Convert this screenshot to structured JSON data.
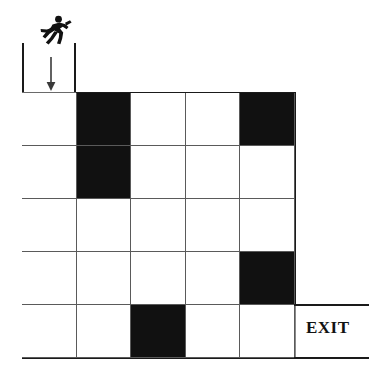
{
  "figure": {
    "name": "maze-puzzle",
    "grid_rows": 5,
    "grid_cols": 5
  },
  "entrance": {
    "icon_name": "running-person-icon",
    "arrow_icon_name": "arrow-down-icon",
    "position_label": "top-left",
    "column": 1
  },
  "exit": {
    "label": "EXIT",
    "position_label": "right-bottom-row",
    "row": 5
  },
  "colors": {
    "blocked_cell": "#111111",
    "open_cell": "#ffffff",
    "grid_line": "#5a5a5a",
    "outer_wall": "#1a1a1a"
  },
  "chart_data": {
    "type": "heatmap",
    "title": "",
    "xlabel": "",
    "ylabel": "",
    "categories": [
      "c1",
      "c2",
      "c3",
      "c4",
      "c5"
    ],
    "rows": [
      "r1",
      "r2",
      "r3",
      "r4",
      "r5"
    ],
    "legend": [
      "open",
      "blocked"
    ],
    "values": [
      [
        0,
        1,
        0,
        0,
        1
      ],
      [
        0,
        1,
        0,
        0,
        0
      ],
      [
        0,
        0,
        0,
        0,
        0
      ],
      [
        0,
        0,
        0,
        0,
        1
      ],
      [
        0,
        0,
        1,
        0,
        0
      ]
    ]
  },
  "grid": {
    "rows": [
      {
        "cells": [
          {
            "blocked": false
          },
          {
            "blocked": true
          },
          {
            "blocked": false
          },
          {
            "blocked": false
          },
          {
            "blocked": true
          }
        ]
      },
      {
        "cells": [
          {
            "blocked": false
          },
          {
            "blocked": true
          },
          {
            "blocked": false
          },
          {
            "blocked": false
          },
          {
            "blocked": false
          }
        ]
      },
      {
        "cells": [
          {
            "blocked": false
          },
          {
            "blocked": false
          },
          {
            "blocked": false
          },
          {
            "blocked": false
          },
          {
            "blocked": false
          }
        ]
      },
      {
        "cells": [
          {
            "blocked": false
          },
          {
            "blocked": false
          },
          {
            "blocked": false
          },
          {
            "blocked": false
          },
          {
            "blocked": true
          }
        ]
      },
      {
        "cells": [
          {
            "blocked": false
          },
          {
            "blocked": false
          },
          {
            "blocked": true
          },
          {
            "blocked": false
          },
          {
            "blocked": false
          }
        ]
      }
    ]
  }
}
